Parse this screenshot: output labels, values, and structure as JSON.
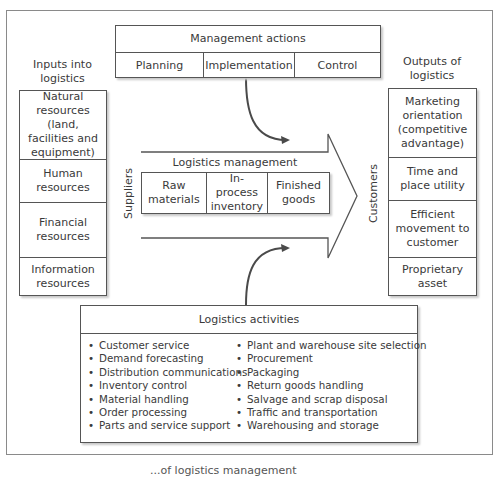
{
  "diagram": {
    "management_actions": {
      "title": "Management actions",
      "items": [
        "Planning",
        "Implementation",
        "Control"
      ]
    },
    "inputs": {
      "title": "Inputs into logistics",
      "title_lines": [
        "Inputs into",
        "logistics"
      ],
      "items": [
        "Natural resources (land, facilities and equipment)",
        "Human resources",
        "Financial resources",
        "Information resources"
      ]
    },
    "outputs": {
      "title": "Outputs of logistics",
      "title_lines": [
        "Outputs of",
        "logistics"
      ],
      "items": [
        "Marketing orientation (competitive advantage)",
        "Time and place utility",
        "Efficient movement to customer",
        "Proprietary asset"
      ]
    },
    "flow": {
      "left_label": "Suppliers",
      "right_label": "Customers",
      "center_title": "Logistics management",
      "stages": [
        "Raw materials",
        "In-process inventory",
        "Finished goods"
      ]
    },
    "activities": {
      "title": "Logistics activities",
      "left": [
        "Customer service",
        "Demand forecasting",
        "Distribution communications",
        "Inventory control",
        "Material handling",
        "Order processing",
        "Parts and service support"
      ],
      "right": [
        "Plant and warehouse site selection",
        "Procurement",
        "Packaging",
        "Return goods handling",
        "Salvage and scrap disposal",
        "Traffic and transportation",
        "Warehousing and storage"
      ]
    },
    "caption_partial": "...of logistics management"
  },
  "colors": {
    "line": "#555555",
    "arrow": "#4a4a4a",
    "frame": "#8a8a8a",
    "text": "#3a3a3a"
  }
}
